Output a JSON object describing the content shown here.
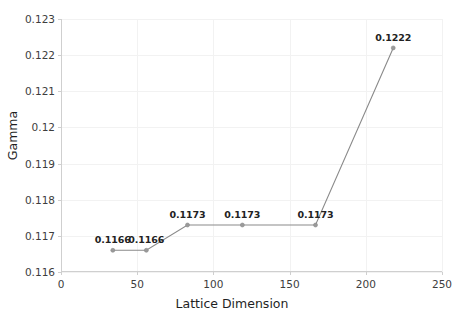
{
  "chart_data": {
    "type": "line",
    "title": "",
    "xlabel": "Lattice Dimension",
    "ylabel": "Gamma",
    "xlim": [
      0,
      250
    ],
    "ylim": [
      0.116,
      0.123
    ],
    "grid": true,
    "legend": "none",
    "xticks": [
      0,
      50,
      100,
      150,
      200,
      250
    ],
    "xtick_labels": [
      "0",
      "50",
      "100",
      "150",
      "200",
      "250"
    ],
    "yticks": [
      0.116,
      0.117,
      0.118,
      0.119,
      0.12,
      0.121,
      0.122,
      0.123
    ],
    "ytick_labels": [
      "0.116",
      "0.117",
      "0.118",
      "0.119",
      "0.12",
      "0.121",
      "0.122",
      "0.123"
    ],
    "series": [
      {
        "name": "Gamma vs Lattice Dimension",
        "x": [
          34,
          56,
          83,
          119,
          167,
          218
        ],
        "y": [
          0.1166,
          0.1166,
          0.1173,
          0.1173,
          0.1173,
          0.1222
        ],
        "point_labels": [
          "0.1166",
          "0.1166",
          "0.1173",
          "0.1173",
          "0.1173",
          "0.1222"
        ],
        "line_color": "#8a8a8a",
        "marker_color": "#9a9a9a"
      }
    ]
  },
  "colors": {
    "background": "#ffffff",
    "grid": "#f2f2f2",
    "axis": "#cfcfcf",
    "text": "#1f1f1f",
    "series_line": "#8a8a8a"
  }
}
